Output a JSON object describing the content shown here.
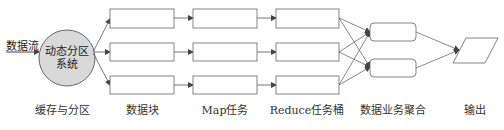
{
  "diagram": {
    "input_label": "数据流",
    "partition_node": {
      "line1": "动态分区",
      "line2": "系统",
      "fill": "#d9d9d9"
    },
    "stage_labels": [
      {
        "text": "缓存与分区",
        "x": 62
      },
      {
        "text": "数据块",
        "x": 142
      },
      {
        "text": "Map任务",
        "x": 225
      },
      {
        "text": "Reduce任务桶",
        "x": 307
      },
      {
        "text": "数据业务聚合",
        "x": 393
      },
      {
        "text": "输出",
        "x": 475
      }
    ],
    "columns": {
      "data_blocks": 3,
      "map_tasks": 3,
      "reduce_buckets": 3,
      "aggregation_nodes": 2,
      "output_nodes": 1
    },
    "colors": {
      "stroke": "#555555",
      "text": "#333333"
    }
  }
}
